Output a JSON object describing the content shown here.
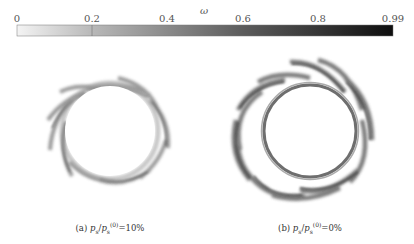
{
  "colorbar": {
    "title": "ω",
    "ticks": [
      {
        "label": "0",
        "value": 0
      },
      {
        "label": "0.2",
        "value": 0.2
      },
      {
        "label": "0.4",
        "value": 0.4
      },
      {
        "label": "0.6",
        "value": 0.6
      },
      {
        "label": "0.8",
        "value": 0.8
      },
      {
        "label": "0.99",
        "value": 0.99
      }
    ],
    "min": 0,
    "max": 0.99,
    "color_low": "#f2f2f2",
    "color_high": "#111111"
  },
  "panels": [
    {
      "id": "a",
      "caption_prefix": "(a) ",
      "caption_ratio_num": "p",
      "caption_ratio_num_sub": "s",
      "caption_ratio_den": "p",
      "caption_ratio_den_sub": "s",
      "caption_ratio_den_sup": "(0)",
      "caption_value": "=10%",
      "description": "Damage field around circular opening, support pressure ratio 10%"
    },
    {
      "id": "b",
      "caption_prefix": "(b) ",
      "caption_ratio_num": "p",
      "caption_ratio_num_sub": "s",
      "caption_ratio_den": "p",
      "caption_ratio_den_sub": "s",
      "caption_ratio_den_sup": "(0)",
      "caption_value": "=0%",
      "description": "Damage field around circular opening, support pressure ratio 0%"
    }
  ]
}
